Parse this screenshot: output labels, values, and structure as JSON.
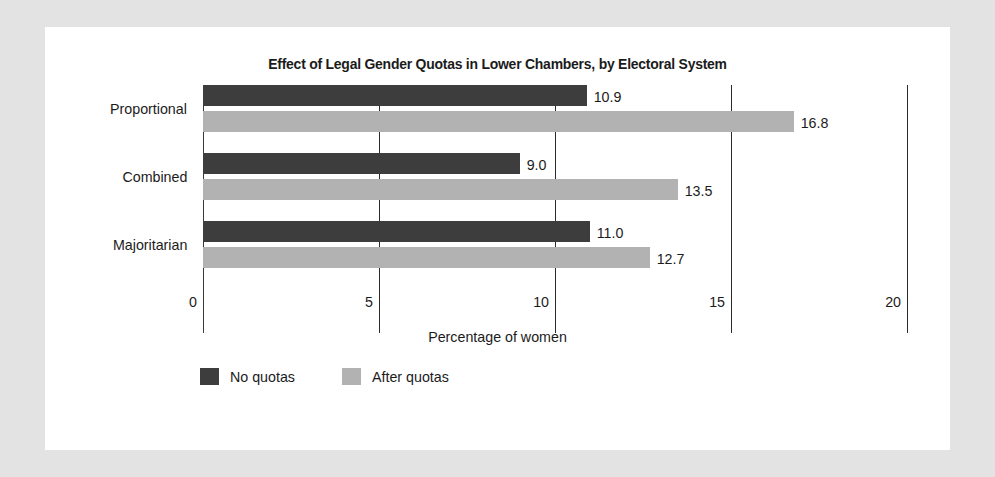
{
  "card": {
    "background": "#ffffff",
    "page_background": "#e3e3e3"
  },
  "chart_data": {
    "type": "bar",
    "orientation": "horizontal",
    "title": "Effect of Legal Gender Quotas in Lower Chambers, by Electoral System",
    "xlabel": "Percentage of women",
    "ylabel": "",
    "categories": [
      "Proportional",
      "Combined",
      "Majoritarian"
    ],
    "series": [
      {
        "name": "No quotas",
        "color": "#3d3d3d",
        "values": [
          10.9,
          9.0,
          11.0
        ],
        "labels": [
          "10.9",
          "9.0",
          "11.0"
        ]
      },
      {
        "name": "After quotas",
        "color": "#b2b2b2",
        "values": [
          16.8,
          13.5,
          12.7
        ],
        "labels": [
          "16.8",
          "13.5",
          "12.7"
        ]
      }
    ],
    "xlim": [
      0,
      20
    ],
    "xticks": [
      0,
      5,
      10,
      15,
      20
    ],
    "xtick_labels": [
      "0",
      "5",
      "10",
      "15",
      "20"
    ],
    "grid": true,
    "legend_position": "bottom-left"
  },
  "legend": {
    "items": [
      {
        "label": "No quotas",
        "color": "#3d3d3d"
      },
      {
        "label": "After quotas",
        "color": "#b2b2b2"
      }
    ]
  }
}
